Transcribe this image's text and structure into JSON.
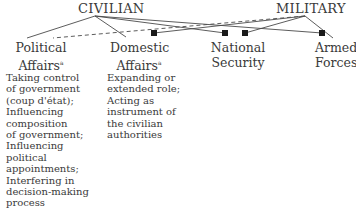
{
  "top_nodes": {
    "civilian": "CIVILIAN",
    "military": "MILITARY"
  },
  "domains": [
    {
      "label_line1": "Political",
      "label_line2": "Affairs",
      "footnote": "a"
    },
    {
      "label_line1": "Domestic",
      "label_line2": "Affairs",
      "footnote": "a"
    },
    {
      "label_line1": "National",
      "label_line2": "Security"
    },
    {
      "label_line1": "Armed",
      "label_line2": "Forces"
    }
  ],
  "descriptions": {
    "political": "Taking control\nof government\n(coup d'état);\nInfluencing\ncomposition\nof government;\nInfluencing\npolitical\nappointments;\nInterfering in\ndecision-making\nprocess",
    "domestic": "Expanding or\nextended role;\nActing as\ninstrument of\nthe civilian\nauthorities"
  },
  "colors": {
    "line": "#4a4a4a",
    "marker": "#1a1a1a",
    "text": "#3a3a3a"
  }
}
